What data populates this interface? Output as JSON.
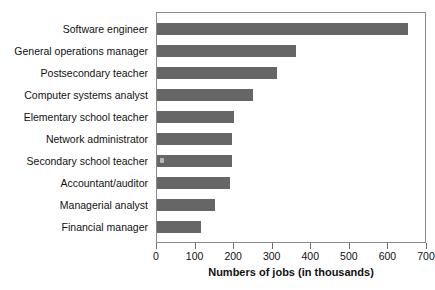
{
  "chart_data": {
    "type": "bar",
    "orientation": "horizontal",
    "title": "",
    "xlabel": "Numbers of jobs (in thousands)",
    "ylabel": "",
    "categories": [
      "Software engineer",
      "General operations manager",
      "Postsecondary teacher",
      "Computer systems analyst",
      "Elementary school teacher",
      "Network administrator",
      "Secondary school teacher",
      "Accountant/auditor",
      "Managerial analyst",
      "Financial manager"
    ],
    "values": [
      650,
      360,
      310,
      250,
      200,
      195,
      195,
      190,
      150,
      115
    ],
    "xlim": [
      0,
      700
    ],
    "xticks": [
      0,
      100,
      200,
      300,
      400,
      500,
      600,
      700
    ],
    "xticklabels": [
      "0",
      "100",
      "200",
      "300",
      "400",
      "500",
      "600",
      "700"
    ],
    "grid": false,
    "legend": false,
    "bar_color": "#666666",
    "frame_color": "#8a8a8a",
    "background": "#ffffff"
  }
}
